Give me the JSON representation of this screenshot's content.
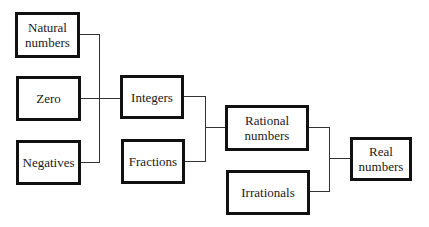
{
  "diagram": {
    "type": "hierarchy",
    "nodes": [
      {
        "id": "natural",
        "label": "Natural\nnumbers",
        "lines": [
          "Natural",
          "numbers"
        ]
      },
      {
        "id": "zero",
        "label": "Zero"
      },
      {
        "id": "negatives",
        "label": "Negatives"
      },
      {
        "id": "integers",
        "label": "Integers"
      },
      {
        "id": "fractions",
        "label": "Fractions"
      },
      {
        "id": "rational",
        "label": "Rational\nnumbers",
        "lines": [
          "Rational",
          "numbers"
        ]
      },
      {
        "id": "irrationals",
        "label": "Irrationals"
      },
      {
        "id": "real",
        "label": "Real\nnumbers",
        "lines": [
          "Real",
          "numbers"
        ]
      }
    ],
    "edges": [
      {
        "from": [
          "natural",
          "zero",
          "negatives"
        ],
        "to": "integers"
      },
      {
        "from": [
          "integers",
          "fractions"
        ],
        "to": "rational"
      },
      {
        "from": [
          "rational",
          "irrationals"
        ],
        "to": "real"
      }
    ]
  }
}
